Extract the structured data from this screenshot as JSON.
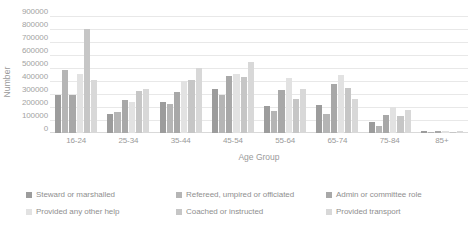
{
  "chart_data": {
    "type": "bar",
    "title": "",
    "xlabel": "Age Group",
    "ylabel": "Number",
    "ylim": [
      0,
      900000
    ],
    "ytick_values": [
      900000,
      800000,
      700000,
      600000,
      500000,
      400000,
      300000,
      200000,
      100000,
      0
    ],
    "ytick_labels": [
      "900000",
      "800000",
      "700000",
      "600000",
      "500000",
      "400000",
      "300000",
      "200000",
      "100000",
      "0"
    ],
    "grid": true,
    "legend_position": "bottom",
    "categories": [
      "16-24",
      "25-34",
      "35-44",
      "45-54",
      "55-64",
      "65-74",
      "75-84",
      "85+"
    ],
    "series": [
      {
        "name": "Steward or marshalled",
        "color": "#9c9c9c",
        "values": [
          290000,
          150000,
          240000,
          340000,
          205000,
          215000,
          85000,
          12000
        ]
      },
      {
        "name": "Refereed, umpired or officiated",
        "color": "#b5b5b5",
        "values": [
          485000,
          165000,
          225000,
          290000,
          170000,
          150000,
          55000,
          8000
        ]
      },
      {
        "name": "Admin or committee role",
        "color": "#a8a8a8",
        "values": [
          290000,
          255000,
          315000,
          435000,
          330000,
          375000,
          140000,
          14000
        ]
      },
      {
        "name": "Provided any other help",
        "color": "#e2e2e2",
        "values": [
          455000,
          240000,
          400000,
          455000,
          420000,
          445000,
          200000,
          18000
        ]
      },
      {
        "name": "Coached or instructed",
        "color": "#c6c6c6",
        "values": [
          800000,
          320000,
          410000,
          430000,
          260000,
          345000,
          130000,
          10000
        ]
      },
      {
        "name": "Provided transport",
        "color": "#d8d8d8",
        "values": [
          410000,
          335000,
          500000,
          545000,
          340000,
          265000,
          175000,
          15000
        ]
      }
    ]
  },
  "legend": {
    "items": [
      {
        "label": "Steward or marshalled",
        "color": "#9c9c9c"
      },
      {
        "label": "Refereed, umpired or officiated",
        "color": "#b5b5b5"
      },
      {
        "label": "Admin or committee role",
        "color": "#a8a8a8"
      },
      {
        "label": "Provided any other help",
        "color": "#e2e2e2"
      },
      {
        "label": "Coached or instructed",
        "color": "#c6c6c6"
      },
      {
        "label": "Provided transport",
        "color": "#d8d8d8"
      }
    ]
  }
}
